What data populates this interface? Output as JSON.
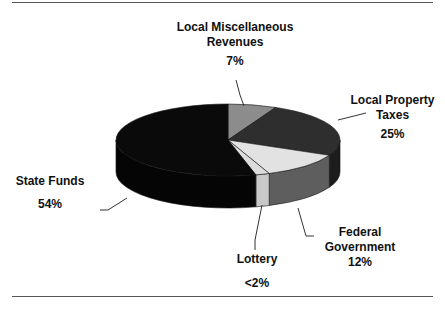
{
  "chart_data": {
    "type": "pie",
    "style": "3d-pie",
    "title": "",
    "categories": [
      "Local Miscellaneous Revenues",
      "Local Property Taxes",
      "Federal Government",
      "Lottery",
      "State Funds"
    ],
    "values": [
      7,
      25,
      12,
      2,
      54
    ],
    "value_labels": [
      "7%",
      "25%",
      "12%",
      "<2%",
      "54%"
    ],
    "colors_top": [
      "#8c8c8c",
      "#2e2e2e",
      "#e2e2e2",
      "#dcdcdc",
      "#0a0a0a"
    ],
    "colors_side": [
      "#6e6e6e",
      "#1c1c1c",
      "#5e5e5e",
      "#c8c8c8",
      "#050505"
    ],
    "start_angle_deg": 0,
    "direction": "clockwise",
    "legend": "none (leader-line labels)"
  },
  "labels": {
    "misc": {
      "name_line1": "Local Miscellaneous",
      "name_line2": "Revenues",
      "pct": "7%"
    },
    "prop": {
      "name_line1": "Local Property",
      "name_line2": "Taxes",
      "pct": "25%"
    },
    "state": {
      "name": "State Funds",
      "pct": "54%"
    },
    "fed": {
      "name_line1": "Federal",
      "name_line2": "Government",
      "pct": "12%"
    },
    "lot": {
      "name": "Lottery",
      "pct": "<2%"
    }
  }
}
